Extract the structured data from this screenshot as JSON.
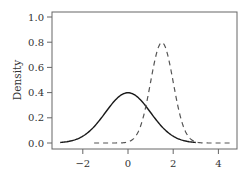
{
  "chart_data": {
    "type": "line",
    "title": "",
    "xlabel": "",
    "ylabel": "Density",
    "xlim": [
      -3.3,
      4.8
    ],
    "ylim": [
      -0.05,
      1.0
    ],
    "x_ticks": [
      -2,
      0,
      2,
      4
    ],
    "x_tick_labels": [
      "−2",
      "0",
      "2",
      "4"
    ],
    "y_ticks": [
      0.0,
      0.2,
      0.4,
      0.6,
      0.8,
      1.0
    ],
    "y_tick_labels": [
      "0.0",
      "0.2",
      "0.4",
      "0.6",
      "0.8",
      "1.0"
    ],
    "grid": false,
    "legend": null,
    "series": [
      {
        "name": "Normal(0, 1) density",
        "style": "solid",
        "color": "#1a1a1a",
        "distribution": {
          "mean": 0,
          "sd": 1
        },
        "x_range": [
          -3,
          3
        ],
        "x": [
          -3,
          -2.5,
          -2,
          -1.5,
          -1,
          -0.5,
          0,
          0.5,
          1,
          1.5,
          2,
          2.5,
          3
        ],
        "values": [
          0.004,
          0.018,
          0.054,
          0.13,
          0.242,
          0.352,
          0.399,
          0.352,
          0.242,
          0.13,
          0.054,
          0.018,
          0.004
        ]
      },
      {
        "name": "Normal(1.5, 0.5) density",
        "style": "dashed",
        "color": "#555555",
        "distribution": {
          "mean": 1.5,
          "sd": 0.5
        },
        "x_range": [
          -1.5,
          4.5
        ],
        "x": [
          -1.5,
          -1,
          -0.5,
          0,
          0.5,
          1,
          1.5,
          2,
          2.5,
          3,
          3.5,
          4,
          4.5
        ],
        "values": [
          0.0,
          0.0,
          0.0,
          0.004,
          0.108,
          0.484,
          0.798,
          0.484,
          0.108,
          0.004,
          0.0,
          0.0,
          0.0
        ]
      }
    ]
  }
}
